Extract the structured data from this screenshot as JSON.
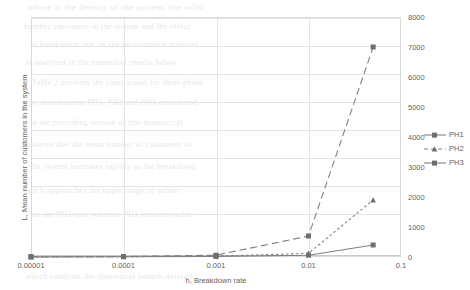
{
  "chart_data": {
    "type": "line",
    "title": "",
    "xlabel": "h, Breakdown rate",
    "ylabel": "L, Mean number of customers in the system",
    "xscale": "log",
    "xlim": [
      1e-05,
      0.1
    ],
    "ylim": [
      0,
      8000
    ],
    "grid": true,
    "legend_position": "right",
    "yaxis_side": "right",
    "xticks": [
      "0.00001",
      "0.0001",
      "0.001",
      "0.01",
      "0.1"
    ],
    "xtick_values": [
      1e-05,
      0.0001,
      0.001,
      0.01,
      0.1
    ],
    "yticks": [
      "0",
      "1000",
      "2000",
      "3000",
      "4000",
      "5000",
      "6000",
      "7000",
      "8000"
    ],
    "ytick_values": [
      0,
      1000,
      2000,
      3000,
      4000,
      5000,
      6000,
      7000,
      8000
    ],
    "x": [
      1e-05,
      0.0001,
      0.001,
      0.01,
      0.05
    ],
    "series": [
      {
        "name": "PH1",
        "values": [
          5,
          8,
          20,
          60,
          400
        ],
        "line_style": "solid",
        "marker": "square",
        "color": "#808080"
      },
      {
        "name": "PH2",
        "values": [
          5,
          10,
          30,
          120,
          1900
        ],
        "line_style": "dotted",
        "marker": "triangle",
        "color": "#808080"
      },
      {
        "name": "PH3",
        "values": [
          8,
          15,
          60,
          700,
          7000
        ],
        "line_style": "dashed",
        "marker": "square",
        "color": "#808080"
      }
    ]
  },
  "legend": {
    "items": [
      {
        "label": "PH1"
      },
      {
        "label": "PH2"
      },
      {
        "label": "PH3"
      }
    ]
  },
  "background_text": {
    "lines": [
      "where      is the density of the system, the solid",
      "number customers in the  system and the effect",
      "of    breakdown rate on the performance measure",
      "is   analyzed   in   the   numerical   results   below",
      "Table 2 presents the comparison for three phase",
      "type distributions PH1, PH2 and PH3 considered",
      "in   the  preceding  section  of  this  manuscript",
      "observe that the mean number of customers in",
      "the system increases rapidly as the breakdown",
      "rate h approaches the upper range of values",
      "for the PH3 case whereas PH1 remains stable",
      "which confirms the theoretical bounds derived"
    ]
  }
}
